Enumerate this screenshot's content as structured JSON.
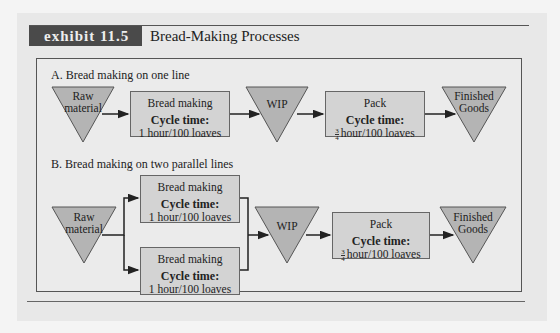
{
  "exhibit": {
    "tag": "exhibit 11.5",
    "title": "Bread-Making Processes"
  },
  "section_a": {
    "label": "A. Bread making on one line",
    "raw": "Raw material",
    "raw_l1": "Raw",
    "raw_l2": "material",
    "bread": {
      "title": "Bread making",
      "cycle_label": "Cycle time:",
      "cycle_value": "1 hour/100 loaves"
    },
    "wip": "WIP",
    "pack": {
      "title": "Pack",
      "cycle_label": "Cycle time:",
      "frac_num": "3",
      "frac_den": "4",
      "cycle_value": "hour/100 loaves"
    },
    "finished_l1": "Finished",
    "finished_l2": "Goods"
  },
  "section_b": {
    "label": "B. Bread making on two parallel lines",
    "raw_l1": "Raw",
    "raw_l2": "material",
    "bread_top": {
      "title": "Bread making",
      "cycle_label": "Cycle time:",
      "cycle_value": "1 hour/100 loaves"
    },
    "bread_bottom": {
      "title": "Bread making",
      "cycle_label": "Cycle time:",
      "cycle_value": "1 hour/100 loaves"
    },
    "wip": "WIP",
    "pack": {
      "title": "Pack",
      "cycle_label": "Cycle time:",
      "frac_num": "3",
      "frac_den": "4",
      "cycle_value": "hour/100 loaves"
    },
    "finished_l1": "Finished",
    "finished_l2": "Goods"
  },
  "colors": {
    "tag_bg": "#4a4a4a",
    "shape_fill": "#b4b4b4",
    "box_fill": "#d3d3d3",
    "panel_bg": "#e8e8e8"
  }
}
